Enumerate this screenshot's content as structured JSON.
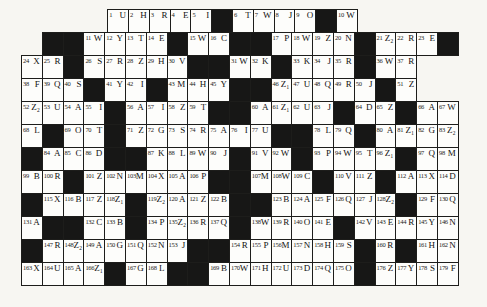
{
  "puzzle": {
    "kind": "acrostic-crossword-grid",
    "columns": 21,
    "row_count": 12,
    "cell_count_numbered": 179,
    "first_number": "1",
    "last_number": "179",
    "colors": {
      "background": "#f7f6f2",
      "cell_white": "#fdfdfb",
      "cell_black": "#171716",
      "line": "#1d1d1b"
    },
    "rows": [
      {
        "offset": 4,
        "cells": [
          {
            "n": "1",
            "l": "U"
          },
          {
            "n": "2",
            "l": "H"
          },
          {
            "n": "3",
            "l": "R"
          },
          {
            "n": "4",
            "l": "E"
          },
          {
            "n": "5",
            "l": "I"
          },
          {
            "b": true
          },
          {
            "n": "6",
            "l": "T"
          },
          {
            "n": "7",
            "l": "W"
          },
          {
            "n": "8",
            "l": "J"
          },
          {
            "n": "9",
            "l": "O"
          },
          {
            "b": true
          },
          {
            "n": "10",
            "l": "W"
          }
        ]
      },
      {
        "offset": 1,
        "cells": [
          {
            "b": true
          },
          {
            "b": true
          },
          {
            "n": "11",
            "l": "W"
          },
          {
            "n": "12",
            "l": "Y"
          },
          {
            "n": "13",
            "l": "T"
          },
          {
            "n": "14",
            "l": "E"
          },
          {
            "b": true
          },
          {
            "n": "15",
            "l": "W"
          },
          {
            "n": "16",
            "l": "C"
          },
          {
            "b": true
          },
          {
            "b": true
          },
          {
            "n": "17",
            "l": "P"
          },
          {
            "n": "18",
            "l": "W"
          },
          {
            "n": "19",
            "l": "Z"
          },
          {
            "n": "20",
            "l": "N"
          },
          {
            "b": true
          },
          {
            "n": "21",
            "l": "Z₂"
          },
          {
            "n": "22",
            "l": "R"
          },
          {
            "n": "23",
            "l": "E"
          },
          {
            "b": true
          }
        ]
      },
      {
        "offset": 0,
        "cells": [
          {
            "n": "24",
            "l": "X"
          },
          {
            "n": "25",
            "l": "R"
          },
          {
            "b": true
          },
          {
            "n": "26",
            "l": "S"
          },
          {
            "n": "27",
            "l": "R"
          },
          {
            "n": "28",
            "l": "Z"
          },
          {
            "n": "29",
            "l": "H"
          },
          {
            "n": "30",
            "l": "V"
          },
          {
            "b": true
          },
          {
            "b": true
          },
          {
            "n": "31",
            "l": "W"
          },
          {
            "n": "32",
            "l": "K"
          },
          {
            "b": true
          },
          {
            "n": "33",
            "l": "K"
          },
          {
            "n": "34",
            "l": "J"
          },
          {
            "n": "35",
            "l": "R"
          },
          {
            "b": true
          },
          {
            "n": "36",
            "l": "W"
          },
          {
            "n": "37",
            "l": "R"
          }
        ]
      },
      {
        "offset": 0,
        "cells": [
          {
            "n": "38",
            "l": "F"
          },
          {
            "n": "39",
            "l": "Q"
          },
          {
            "n": "40",
            "l": "S"
          },
          {
            "b": true
          },
          {
            "n": "41",
            "l": "Y"
          },
          {
            "n": "42",
            "l": "I"
          },
          {
            "b": true
          },
          {
            "n": "43",
            "l": "M"
          },
          {
            "n": "44",
            "l": "H"
          },
          {
            "n": "45",
            "l": "Y"
          },
          {
            "b": true
          },
          {
            "b": true
          },
          {
            "n": "46",
            "l": "Z₁"
          },
          {
            "n": "47",
            "l": "U"
          },
          {
            "n": "48",
            "l": "Q"
          },
          {
            "n": "49",
            "l": "R"
          },
          {
            "n": "50",
            "l": "J"
          },
          {
            "b": true
          },
          {
            "n": "51",
            "l": "Z"
          }
        ]
      },
      {
        "offset": 0,
        "cells": [
          {
            "n": "52",
            "l": "Z₂"
          },
          {
            "n": "53",
            "l": "U"
          },
          {
            "n": "54",
            "l": "A"
          },
          {
            "n": "55",
            "l": "I"
          },
          {
            "b": true
          },
          {
            "n": "56",
            "l": "A"
          },
          {
            "n": "57",
            "l": "I"
          },
          {
            "n": "58",
            "l": "Z"
          },
          {
            "n": "59",
            "l": "T"
          },
          {
            "b": true
          },
          {
            "b": true
          },
          {
            "n": "60",
            "l": "A"
          },
          {
            "n": "61",
            "l": "Z₁"
          },
          {
            "n": "62",
            "l": "U"
          },
          {
            "n": "63",
            "l": "J"
          },
          {
            "b": true
          },
          {
            "n": "64",
            "l": "D"
          },
          {
            "n": "65",
            "l": "Z"
          },
          {
            "b": true
          },
          {
            "n": "66",
            "l": "A"
          },
          {
            "n": "67",
            "l": "W"
          }
        ]
      },
      {
        "offset": 0,
        "cells": [
          {
            "n": "68",
            "l": "L"
          },
          {
            "b": true
          },
          {
            "n": "69",
            "l": "O"
          },
          {
            "n": "70",
            "l": "T"
          },
          {
            "b": true
          },
          {
            "n": "71",
            "l": "Z"
          },
          {
            "n": "72",
            "l": "G"
          },
          {
            "n": "73",
            "l": "S"
          },
          {
            "n": "74",
            "l": "R"
          },
          {
            "n": "75",
            "l": "A"
          },
          {
            "n": "76",
            "l": "I"
          },
          {
            "n": "77",
            "l": "U"
          },
          {
            "b": true
          },
          {
            "b": true
          },
          {
            "n": "78",
            "l": "L"
          },
          {
            "n": "79",
            "l": "Q"
          },
          {
            "b": true
          },
          {
            "n": "80",
            "l": "A"
          },
          {
            "n": "81",
            "l": "Z₁"
          },
          {
            "n": "82",
            "l": "G"
          },
          {
            "n": "83",
            "l": "Z₂"
          }
        ]
      },
      {
        "offset": 0,
        "cells": [
          {
            "b": true
          },
          {
            "n": "84",
            "l": "A"
          },
          {
            "n": "85",
            "l": "C"
          },
          {
            "n": "86",
            "l": "D"
          },
          {
            "b": true
          },
          {
            "b": true
          },
          {
            "n": "87",
            "l": "K"
          },
          {
            "n": "88",
            "l": "L"
          },
          {
            "n": "89",
            "l": "W"
          },
          {
            "n": "90",
            "l": "J"
          },
          {
            "b": true
          },
          {
            "n": "91",
            "l": "V"
          },
          {
            "n": "92",
            "l": "W"
          },
          {
            "b": true
          },
          {
            "n": "93",
            "l": "P"
          },
          {
            "n": "94",
            "l": "W"
          },
          {
            "n": "95",
            "l": "T"
          },
          {
            "n": "96",
            "l": "Z₁"
          },
          {
            "b": true
          },
          {
            "n": "97",
            "l": "Q"
          },
          {
            "n": "98",
            "l": "M"
          }
        ]
      },
      {
        "offset": 0,
        "cells": [
          {
            "n": "99",
            "l": "B"
          },
          {
            "n": "100",
            "l": "R"
          },
          {
            "b": true
          },
          {
            "n": "101",
            "l": "Z"
          },
          {
            "n": "102",
            "l": "N"
          },
          {
            "n": "103",
            "l": "M"
          },
          {
            "n": "104",
            "l": "X"
          },
          {
            "n": "105",
            "l": "A"
          },
          {
            "n": "106",
            "l": "P"
          },
          {
            "b": true
          },
          {
            "b": true
          },
          {
            "n": "107",
            "l": "M"
          },
          {
            "n": "108",
            "l": "W"
          },
          {
            "n": "109",
            "l": "C"
          },
          {
            "b": true
          },
          {
            "n": "110",
            "l": "V"
          },
          {
            "n": "111",
            "l": "Z"
          },
          {
            "b": true
          },
          {
            "n": "112",
            "l": "A"
          },
          {
            "n": "113",
            "l": "X"
          },
          {
            "n": "114",
            "l": "D"
          }
        ]
      },
      {
        "offset": 0,
        "cells": [
          {
            "b": true
          },
          {
            "n": "115",
            "l": "X"
          },
          {
            "n": "116",
            "l": "B"
          },
          {
            "n": "117",
            "l": "Z"
          },
          {
            "n": "118",
            "l": "Z₁"
          },
          {
            "b": true
          },
          {
            "n": "119",
            "l": "Z₂"
          },
          {
            "n": "120",
            "l": "A"
          },
          {
            "n": "121",
            "l": "Z"
          },
          {
            "n": "122",
            "l": "B"
          },
          {
            "b": true
          },
          {
            "b": true
          },
          {
            "n": "123",
            "l": "B"
          },
          {
            "n": "124",
            "l": "A"
          },
          {
            "n": "125",
            "l": "F"
          },
          {
            "n": "126",
            "l": "Q"
          },
          {
            "n": "127",
            "l": "J"
          },
          {
            "n": "128",
            "l": "Z₂"
          },
          {
            "b": true
          },
          {
            "n": "129",
            "l": "F"
          },
          {
            "n": "130",
            "l": "Q"
          }
        ]
      },
      {
        "offset": 0,
        "cells": [
          {
            "n": "131",
            "l": "A"
          },
          {
            "b": true
          },
          {
            "b": true
          },
          {
            "n": "132",
            "l": "C"
          },
          {
            "n": "133",
            "l": "B"
          },
          {
            "b": true
          },
          {
            "n": "134",
            "l": "P"
          },
          {
            "n": "135",
            "l": "Z₂"
          },
          {
            "n": "136",
            "l": "R"
          },
          {
            "n": "137",
            "l": "Q"
          },
          {
            "b": true
          },
          {
            "n": "138",
            "l": "W"
          },
          {
            "n": "139",
            "l": "R"
          },
          {
            "n": "140",
            "l": "O"
          },
          {
            "n": "141",
            "l": "E"
          },
          {
            "b": true
          },
          {
            "n": "142",
            "l": "V"
          },
          {
            "n": "143",
            "l": "E"
          },
          {
            "n": "144",
            "l": "R"
          },
          {
            "n": "145",
            "l": "Y"
          },
          {
            "n": "146",
            "l": "N"
          }
        ]
      },
      {
        "offset": 0,
        "cells": [
          {
            "b": true
          },
          {
            "n": "147",
            "l": "R"
          },
          {
            "n": "148",
            "l": "Z₂"
          },
          {
            "n": "149",
            "l": "A"
          },
          {
            "n": "150",
            "l": "G"
          },
          {
            "n": "151",
            "l": "Q"
          },
          {
            "n": "152",
            "l": "N"
          },
          {
            "n": "153",
            "l": "J"
          },
          {
            "b": true
          },
          {
            "b": true
          },
          {
            "n": "154",
            "l": "R"
          },
          {
            "n": "155",
            "l": "P"
          },
          {
            "n": "156",
            "l": "M"
          },
          {
            "n": "157",
            "l": "N"
          },
          {
            "n": "158",
            "l": "H"
          },
          {
            "n": "159",
            "l": "S"
          },
          {
            "b": true
          },
          {
            "n": "160",
            "l": "R"
          },
          {
            "b": true
          },
          {
            "n": "161",
            "l": "H"
          },
          {
            "n": "162",
            "l": "N"
          }
        ]
      },
      {
        "offset": 0,
        "cells": [
          {
            "n": "163",
            "l": "X"
          },
          {
            "n": "164",
            "l": "U"
          },
          {
            "n": "165",
            "l": "A"
          },
          {
            "n": "166",
            "l": "Z₁"
          },
          {
            "b": true
          },
          {
            "n": "167",
            "l": "G"
          },
          {
            "n": "168",
            "l": "L"
          },
          {
            "b": true
          },
          {
            "b": true
          },
          {
            "n": "169",
            "l": "B"
          },
          {
            "n": "170",
            "l": "W"
          },
          {
            "n": "171",
            "l": "H"
          },
          {
            "n": "172",
            "l": "U"
          },
          {
            "n": "173",
            "l": "D"
          },
          {
            "n": "174",
            "l": "Q"
          },
          {
            "n": "175",
            "l": "O"
          },
          {
            "b": true
          },
          {
            "n": "176",
            "l": "Z"
          },
          {
            "n": "177",
            "l": "Y"
          },
          {
            "n": "178",
            "l": "S"
          },
          {
            "n": "179",
            "l": "F"
          }
        ]
      }
    ]
  }
}
